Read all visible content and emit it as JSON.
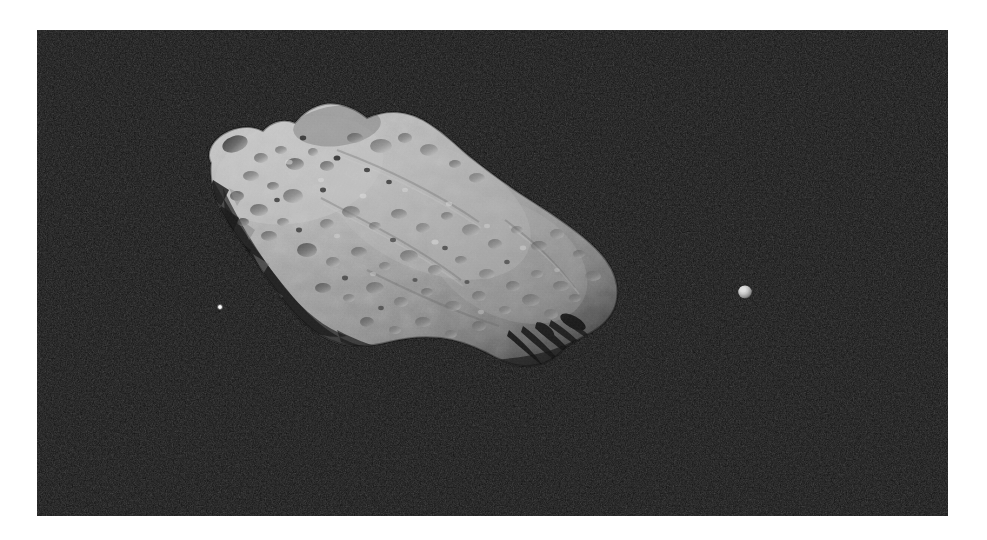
{
  "image": {
    "kind": "astronomical-photograph",
    "subject": "asteroid with small natural satellite",
    "caption": "",
    "frame": {
      "x": 37,
      "y": 30,
      "width": 911,
      "height": 486,
      "page_width": 987,
      "page_height": 540,
      "page_background": "#ffffff",
      "sky_color": "#070707"
    },
    "palette": {
      "sky": "#070707",
      "sky_noise_high": "#1d1d1d",
      "regolith_mid": "#8e8e8e",
      "regolith_bright": "#c9c9c9",
      "regolith_highlight": "#d9d9d9",
      "regolith_shadow": "#3a3a3a",
      "terminator_shadow": "#141414",
      "moon_color": "#cfcfcf"
    },
    "objects": [
      {
        "name": "asteroid",
        "label": "large irregular cratered body",
        "center_x": 400,
        "center_y": 265,
        "approx_width": 440,
        "approx_height": 300,
        "long_axis_tilt_deg": 28,
        "illumination": "lit from upper-left, terminator along lower-right and lower-left",
        "surface": "heavily cratered regolith, saddle-shaped notch on the upper limb",
        "crater_count_visible": 86
      },
      {
        "name": "moon",
        "label": "small satellite",
        "center_x": 745,
        "center_y": 292,
        "approx_width": 13,
        "approx_height": 13,
        "illumination": "lit from upper-left, crescent-to-gibbous"
      },
      {
        "name": "background-point-source",
        "label": "faint bright point in the sky field",
        "center_x": 220,
        "center_y": 307,
        "approx_width": 4,
        "approx_height": 4
      }
    ],
    "annotations": [],
    "overlay_text": []
  }
}
